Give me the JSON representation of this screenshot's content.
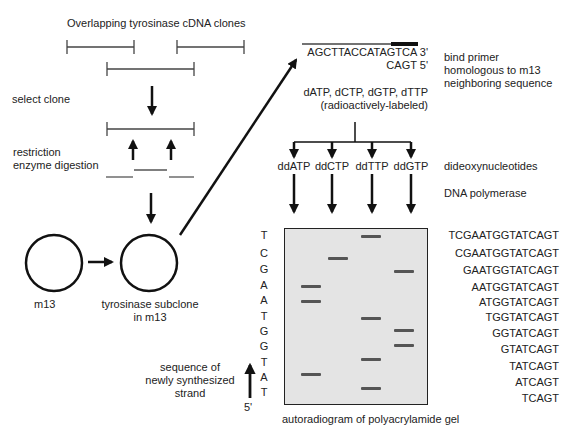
{
  "title": "Overlapping tyrosinase cDNA clones",
  "left_steps": {
    "select_clone": "select clone",
    "restriction_line1": "restriction",
    "restriction_line2": "enzyme digestion",
    "m13_label": "m13",
    "subclone_line1": "tyrosinase subclone",
    "subclone_line2": "in m13"
  },
  "primer": {
    "template_sequence": "AGCTTACCATAGTCA 3'",
    "primer_sequence": "CAGT 5'",
    "description_line1": "bind primer",
    "description_line2": "homologous to m13",
    "description_line3": "neighboring sequence"
  },
  "nucleotides": {
    "line1": "dATP, dCTP, dGTP, dTTP",
    "line2": "(radioactively-labeled)"
  },
  "dideoxy": {
    "lanes": [
      "ddATP",
      "ddCTP",
      "ddTTP",
      "ddGTP"
    ],
    "label": "dideoxynucleotides",
    "polymerase_label": "DNA polymerase"
  },
  "gel": {
    "caption": "autoradiogram of polyacrylamide gel",
    "lane_order": [
      "A",
      "C",
      "T",
      "G"
    ],
    "read_letters": [
      "T",
      "C",
      "G",
      "A",
      "A",
      "T",
      "G",
      "G",
      "T",
      "A",
      "T"
    ],
    "fragments": [
      "TCGAATGGTATCAGT",
      "CGAATGGTATCAGT",
      "GAATGGTATCAGT",
      "AATGGTATCAGT",
      "ATGGTATCAGT",
      "TGGTATCAGT",
      "GGTATCAGT",
      "GTATCAGT",
      "TATCAGT",
      "ATCAGT",
      "TCAGT"
    ],
    "band_color": "#555555",
    "background_color": "#e4e4e4"
  },
  "strand": {
    "label_line1": "sequence of",
    "label_line2": "newly synthesized",
    "label_line3": "strand",
    "end_label": "5'"
  }
}
